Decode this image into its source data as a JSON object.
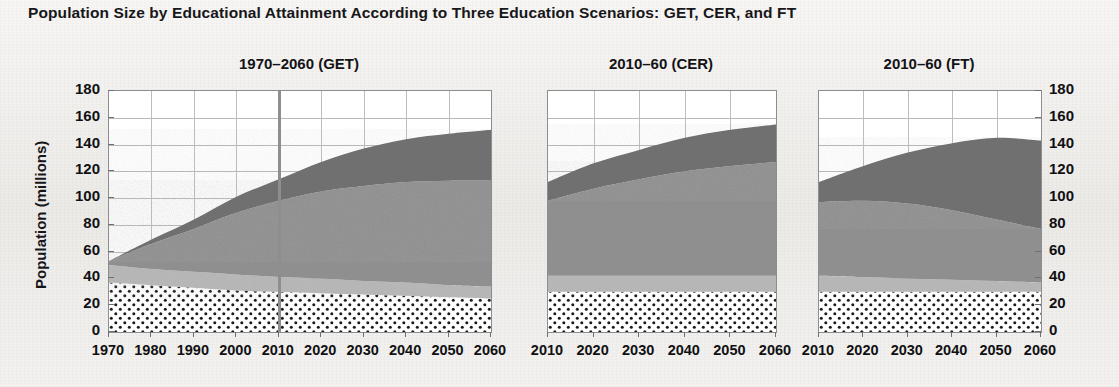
{
  "figure": {
    "title": "Population Size by Educational Attainment According to Three Education Scenarios: GET, CER, and FT",
    "y_axis_label": "Population (millions)"
  },
  "axis": {
    "y_ticks": [
      "180",
      "160",
      "140",
      "120",
      "100",
      "80",
      "60",
      "40",
      "20",
      "0"
    ],
    "y_ticks_right": [
      "180",
      "160",
      "140",
      "120",
      "100",
      "80",
      "60",
      "40",
      "20",
      "0"
    ],
    "y_min": 0,
    "y_max": 180,
    "y_step": 20
  },
  "colors": {
    "band_dark": "#6f6f6f",
    "band_medium": "#8f8f8f",
    "band_light": "#b6b6b6",
    "band_dotted_fill": "#ffffff",
    "band_dotted_dot": "#1a1a1a",
    "panel_background": "#ffffff",
    "page_background": "#f1f0ee",
    "gridline": "#b7b7b7",
    "axis": "#8d8d8d",
    "marker_line": "#8e8e8e"
  },
  "panels": [
    {
      "id": "get",
      "title": "1970–2060 (GET)",
      "x_ticks": [
        "1970",
        "1980",
        "1990",
        "2000",
        "2010",
        "2020",
        "2030",
        "2040",
        "2050",
        "2060"
      ],
      "marker_year": 2010
    },
    {
      "id": "cer",
      "title": "2010–60 (CER)",
      "x_ticks": [
        "2010",
        "2020",
        "2030",
        "2040",
        "2050",
        "2060"
      ],
      "marker_year": null
    },
    {
      "id": "ft",
      "title": "2010–60 (FT)",
      "x_ticks": [
        "2010",
        "2020",
        "2030",
        "2040",
        "2050",
        "2060"
      ],
      "marker_year": null
    }
  ],
  "chart_data": [
    {
      "type": "area",
      "panel": "get",
      "title": "1970–2060 (GET)",
      "xlabel": "",
      "ylabel": "Population (millions)",
      "ylim": [
        0,
        180
      ],
      "grid": true,
      "stacked": true,
      "x": [
        1970,
        1980,
        1990,
        2000,
        2010,
        2020,
        2030,
        2040,
        2050,
        2060
      ],
      "series": [
        {
          "name": "no / low education",
          "style": "dotted",
          "values": [
            37,
            35,
            33,
            31,
            30,
            29,
            28,
            27,
            26,
            25
          ]
        },
        {
          "name": "primary",
          "style": "light-gray",
          "values": [
            13,
            12,
            12,
            12,
            11,
            11,
            10,
            10,
            9,
            9
          ]
        },
        {
          "name": "secondary",
          "style": "medium-gray",
          "values": [
            3,
            19,
            32,
            46,
            57,
            65,
            71,
            75,
            78,
            79
          ]
        },
        {
          "name": "tertiary",
          "style": "dark-gray",
          "values": [
            0,
            3,
            7,
            12,
            16,
            22,
            28,
            32,
            35,
            38
          ]
        }
      ],
      "totals": [
        53,
        69,
        84,
        101,
        114,
        127,
        137,
        144,
        148,
        151
      ]
    },
    {
      "type": "area",
      "panel": "cer",
      "title": "2010–60 (CER)",
      "xlabel": "",
      "ylabel": "",
      "ylim": [
        0,
        180
      ],
      "grid": true,
      "stacked": true,
      "x": [
        2010,
        2020,
        2030,
        2040,
        2050,
        2060
      ],
      "series": [
        {
          "name": "no / low education",
          "style": "dotted",
          "values": [
            30,
            30,
            30,
            30,
            30,
            30
          ]
        },
        {
          "name": "primary",
          "style": "light-gray",
          "values": [
            12,
            12,
            12,
            12,
            12,
            12
          ]
        },
        {
          "name": "secondary",
          "style": "medium-gray",
          "values": [
            56,
            65,
            72,
            78,
            82,
            85
          ]
        },
        {
          "name": "tertiary",
          "style": "dark-gray",
          "values": [
            14,
            19,
            22,
            25,
            27,
            28
          ]
        }
      ],
      "totals": [
        112,
        126,
        136,
        145,
        151,
        155
      ]
    },
    {
      "type": "area",
      "panel": "ft",
      "title": "2010–60 (FT)",
      "xlabel": "",
      "ylabel": "",
      "ylim": [
        0,
        180
      ],
      "grid": true,
      "stacked": true,
      "x": [
        2010,
        2020,
        2030,
        2040,
        2050,
        2060
      ],
      "series": [
        {
          "name": "no / low education",
          "style": "dotted",
          "values": [
            30,
            30,
            30,
            30,
            30,
            30
          ]
        },
        {
          "name": "primary",
          "style": "light-gray",
          "values": [
            12,
            11,
            10,
            9,
            8,
            7
          ]
        },
        {
          "name": "secondary",
          "style": "medium-gray",
          "values": [
            55,
            57,
            56,
            52,
            46,
            40
          ]
        },
        {
          "name": "tertiary",
          "style": "dark-gray",
          "values": [
            15,
            26,
            38,
            50,
            61,
            66
          ]
        }
      ],
      "totals": [
        112,
        124,
        134,
        141,
        145,
        143
      ]
    }
  ]
}
